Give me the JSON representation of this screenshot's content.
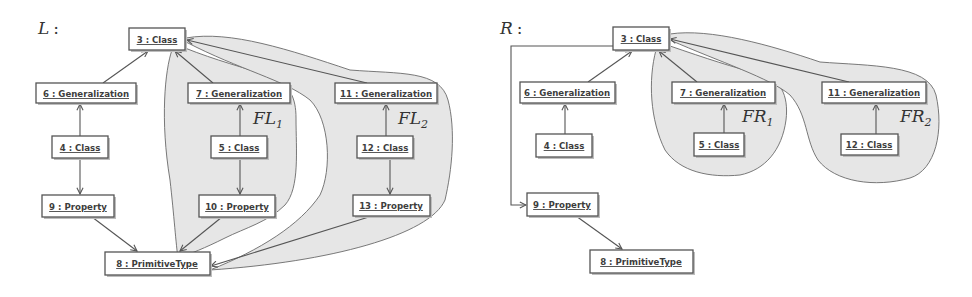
{
  "panels": {
    "left": {
      "label": "L",
      "label_sep": ":",
      "regions": [
        {
          "name": "FL",
          "sub": "1"
        },
        {
          "name": "FL",
          "sub": "2"
        }
      ],
      "nodes": {
        "n3": "3 : Class",
        "n6": "6 : Generalization",
        "n7": "7 : Generalization",
        "n11": "11 : Generalization",
        "n4": "4 : Class",
        "n5": "5 : Class",
        "n12": "12 : Class",
        "n9": "9 : Property",
        "n10": "10 : Property",
        "n13": "13 : Property",
        "n8": "8 : PrimitiveType"
      }
    },
    "right": {
      "label": "R",
      "label_sep": ":",
      "regions": [
        {
          "name": "FR",
          "sub": "1"
        },
        {
          "name": "FR",
          "sub": "2"
        }
      ],
      "nodes": {
        "n3": "3 : Class",
        "n6": "6 : Generalization",
        "n7": "7 : Generalization",
        "n11": "11 : Generalization",
        "n4": "4 : Class",
        "n5": "5 : Class",
        "n12": "12 : Class",
        "n9": "9 : Property",
        "n8": "8 : PrimitiveType"
      }
    }
  },
  "edges": {
    "left": [
      [
        "6 : Generalization",
        "3 : Class"
      ],
      [
        "7 : Generalization",
        "3 : Class"
      ],
      [
        "11 : Generalization",
        "3 : Class"
      ],
      [
        "4 : Class",
        "6 : Generalization"
      ],
      [
        "5 : Class",
        "7 : Generalization"
      ],
      [
        "12 : Class",
        "11 : Generalization"
      ],
      [
        "4 : Class",
        "9 : Property"
      ],
      [
        "5 : Class",
        "10 : Property"
      ],
      [
        "12 : Class",
        "13 : Property"
      ],
      [
        "9 : Property",
        "8 : PrimitiveType"
      ],
      [
        "10 : Property",
        "8 : PrimitiveType"
      ],
      [
        "13 : Property",
        "8 : PrimitiveType"
      ]
    ],
    "right": [
      [
        "6 : Generalization",
        "3 : Class"
      ],
      [
        "7 : Generalization",
        "3 : Class"
      ],
      [
        "11 : Generalization",
        "3 : Class"
      ],
      [
        "4 : Class",
        "6 : Generalization"
      ],
      [
        "5 : Class",
        "7 : Generalization"
      ],
      [
        "12 : Class",
        "11 : Generalization"
      ],
      [
        "3 : Class",
        "9 : Property"
      ],
      [
        "9 : Property",
        "8 : PrimitiveType"
      ]
    ]
  },
  "colors": {
    "region_fill": "#e6e6e6",
    "stroke": "#555555",
    "text": "#3d3d3d"
  }
}
